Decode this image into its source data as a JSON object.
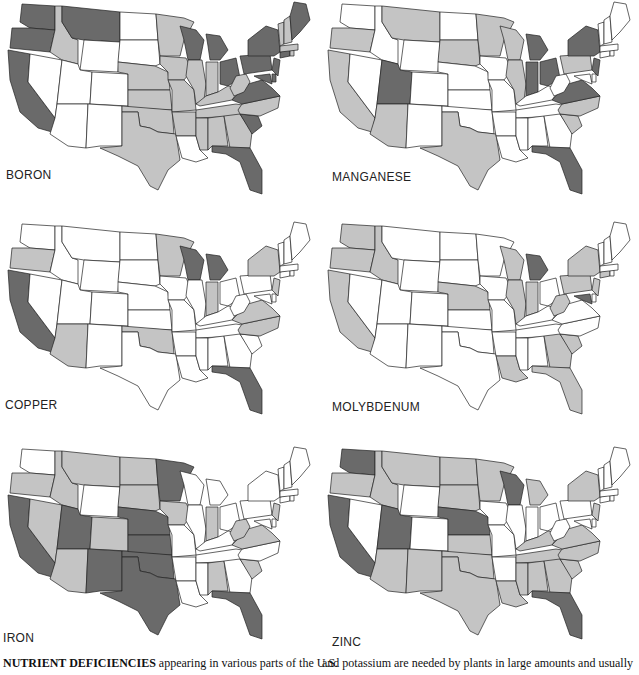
{
  "chart_data": [
    {
      "type": "choropleth",
      "title": "BORON",
      "levels": {
        "none": "#ffffff",
        "moderate": "#c4c4c4",
        "severe": "#6a6a6a"
      },
      "severe": [
        "WA",
        "OR",
        "CA",
        "MT",
        "WI",
        "MI",
        "OH",
        "PA",
        "NY",
        "ME",
        "VA",
        "MD",
        "DE",
        "NJ",
        "CT",
        "SC",
        "FL"
      ],
      "moderate": [
        "ID",
        "MN",
        "IA",
        "NE",
        "KS",
        "MO",
        "IL",
        "IN",
        "KY",
        "WV",
        "TN",
        "NC",
        "GA",
        "AL",
        "MS",
        "AR",
        "OK",
        "TX",
        "VT",
        "NH",
        "MA",
        "RI"
      ],
      "none": [
        "NV",
        "UT",
        "AZ",
        "NM",
        "CO",
        "WY",
        "ND",
        "SD",
        "LA"
      ]
    },
    {
      "type": "choropleth",
      "title": "MANGANESE",
      "levels": {
        "none": "#ffffff",
        "moderate": "#c4c4c4",
        "severe": "#6a6a6a"
      },
      "severe": [
        "UT",
        "MI",
        "IN",
        "OH",
        "NY",
        "NJ",
        "VA",
        "FL"
      ],
      "moderate": [
        "OR",
        "CA",
        "AZ",
        "MT",
        "SD",
        "MN",
        "WI",
        "IL",
        "PA",
        "NC",
        "SC",
        "TX"
      ],
      "none": [
        "WA",
        "ID",
        "NV",
        "WY",
        "CO",
        "NM",
        "ND",
        "NE",
        "KS",
        "OK",
        "IA",
        "MO",
        "AR",
        "LA",
        "MS",
        "AL",
        "GA",
        "TN",
        "KY",
        "WV",
        "MD",
        "DE",
        "VT",
        "NH",
        "ME",
        "MA",
        "CT",
        "RI"
      ]
    },
    {
      "type": "choropleth",
      "title": "COPPER",
      "levels": {
        "none": "#ffffff",
        "moderate": "#c4c4c4",
        "severe": "#6a6a6a"
      },
      "severe": [
        "CA",
        "WI",
        "MI",
        "FL"
      ],
      "moderate": [
        "OR",
        "AZ",
        "OK",
        "MN",
        "IN",
        "NY",
        "NJ",
        "VA",
        "NC"
      ],
      "none": [
        "WA",
        "ID",
        "NV",
        "UT",
        "MT",
        "WY",
        "CO",
        "NM",
        "ND",
        "SD",
        "NE",
        "KS",
        "TX",
        "IA",
        "MO",
        "AR",
        "LA",
        "IL",
        "KY",
        "TN",
        "MS",
        "AL",
        "GA",
        "SC",
        "OH",
        "WV",
        "PA",
        "MD",
        "DE",
        "CT",
        "RI",
        "MA",
        "VT",
        "NH",
        "ME"
      ]
    },
    {
      "type": "choropleth",
      "title": "MOLYBDENUM",
      "levels": {
        "none": "#ffffff",
        "moderate": "#c4c4c4",
        "severe": "#6a6a6a"
      },
      "severe": [
        "MI",
        "MD"
      ],
      "moderate": [
        "WA",
        "OR",
        "CA",
        "ID",
        "NE",
        "WI",
        "IL",
        "IN",
        "WV",
        "PA",
        "NY",
        "NJ",
        "CT",
        "LA",
        "GA",
        "SC",
        "FL"
      ],
      "none": [
        "NV",
        "UT",
        "AZ",
        "MT",
        "WY",
        "CO",
        "NM",
        "ND",
        "SD",
        "KS",
        "OK",
        "TX",
        "MN",
        "IA",
        "MO",
        "AR",
        "MS",
        "AL",
        "TN",
        "KY",
        "OH",
        "VA",
        "NC",
        "DE",
        "RI",
        "MA",
        "VT",
        "NH",
        "ME"
      ]
    },
    {
      "type": "choropleth",
      "title": "IRON",
      "levels": {
        "none": "#ffffff",
        "moderate": "#c4c4c4",
        "severe": "#6a6a6a"
      },
      "severe": [
        "CA",
        "UT",
        "NM",
        "NE",
        "KS",
        "OK",
        "TX",
        "MN",
        "FL"
      ],
      "moderate": [
        "OR",
        "ID",
        "NV",
        "AZ",
        "MT",
        "CO",
        "ND",
        "SD",
        "IA",
        "IN",
        "WV",
        "VA",
        "NJ",
        "AL",
        "SC"
      ],
      "none": [
        "WA",
        "WY",
        "MO",
        "AR",
        "LA",
        "MS",
        "TN",
        "KY",
        "IL",
        "WI",
        "MI",
        "OH",
        "PA",
        "NY",
        "MD",
        "DE",
        "NC",
        "GA",
        "CT",
        "RI",
        "MA",
        "VT",
        "NH",
        "ME"
      ]
    },
    {
      "type": "choropleth",
      "title": "ZINC",
      "levels": {
        "none": "#ffffff",
        "moderate": "#c4c4c4",
        "severe": "#6a6a6a"
      },
      "severe": [
        "WA",
        "CA",
        "UT",
        "NE",
        "WI",
        "FL"
      ],
      "moderate": [
        "OR",
        "ID",
        "MT",
        "ND",
        "SD",
        "MN",
        "KS",
        "OK",
        "TX",
        "NM",
        "AZ",
        "MI",
        "NY",
        "NJ",
        "KY",
        "TN",
        "VA",
        "NC",
        "SC",
        "GA",
        "AL",
        "MS",
        "LA"
      ],
      "none": [
        "NV",
        "WY",
        "CO",
        "IA",
        "MO",
        "AR",
        "IL",
        "IN",
        "OH",
        "PA",
        "WV",
        "MD",
        "DE",
        "CT",
        "RI",
        "MA",
        "VT",
        "NH",
        "ME"
      ]
    }
  ],
  "labels": {
    "boron": "BORON",
    "manganese": "MANGANESE",
    "copper": "COPPER",
    "molybdenum": "MOLYBDENUM",
    "iron": "IRON",
    "zinc": "ZINC"
  },
  "caption": {
    "left_bold": "NUTRIENT DEFICIENCIES",
    "left_rest": " appearing in various parts of the U.S.",
    "right": "and potassium are needed by plants in large amounts and usually"
  }
}
